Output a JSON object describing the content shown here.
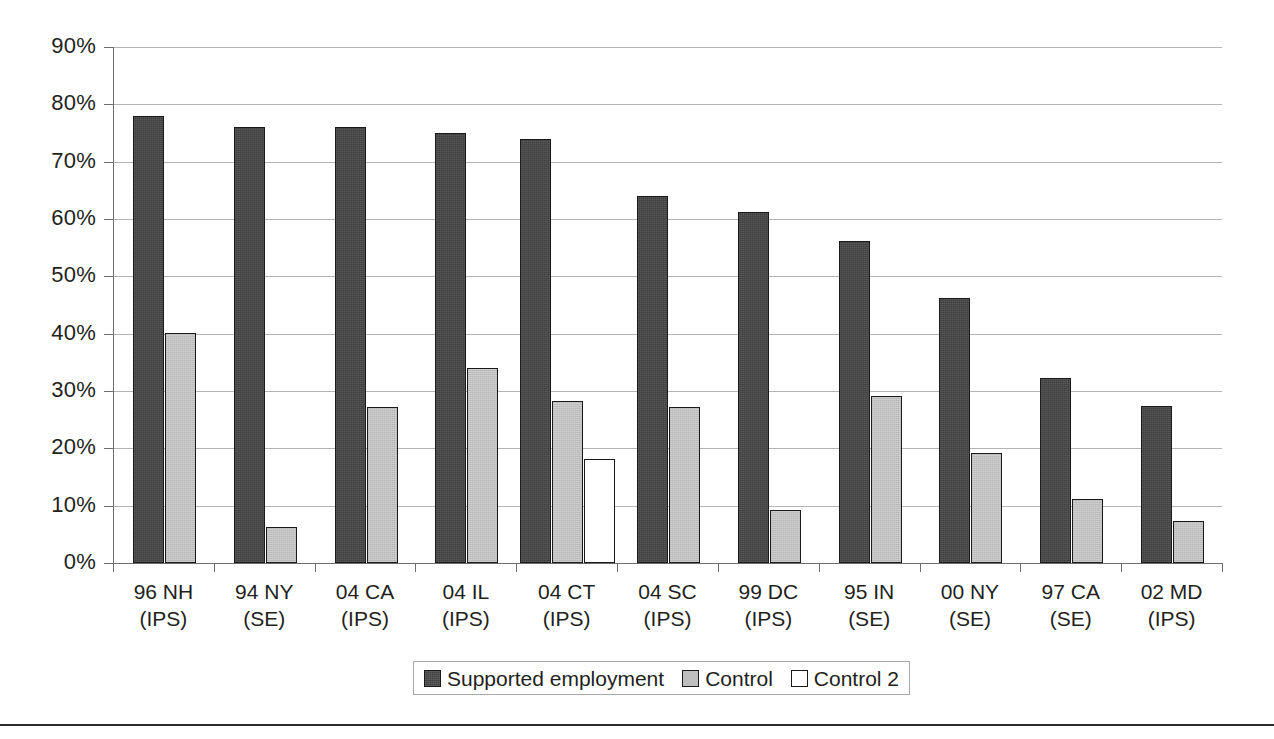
{
  "chart_data": {
    "type": "bar",
    "title": "",
    "xlabel": "",
    "ylabel": "",
    "ylim": [
      0,
      90
    ],
    "ytick_labels": [
      "90%",
      "80%",
      "70%",
      "60%",
      "50%",
      "40%",
      "30%",
      "20%",
      "10%",
      "0%"
    ],
    "ytick_values": [
      90,
      80,
      70,
      60,
      50,
      40,
      30,
      20,
      10,
      0
    ],
    "grid": true,
    "legend_position": "bottom-center",
    "categories": [
      "96 NH (IPS)",
      "94 NY (SE)",
      "04 CA (IPS)",
      "04 IL (IPS)",
      "04 CT (IPS)",
      "04 SC (IPS)",
      "99 DC (IPS)",
      "95 IN (SE)",
      "00 NY (SE)",
      "97 CA (SE)",
      "02 MD (IPS)"
    ],
    "category_lines": [
      {
        "line1": "96 NH",
        "line2": "(IPS)"
      },
      {
        "line1": "94 NY",
        "line2": "(SE)"
      },
      {
        "line1": "04 CA",
        "line2": "(IPS)"
      },
      {
        "line1": "04 IL",
        "line2": "(IPS)"
      },
      {
        "line1": "04 CT",
        "line2": "(IPS)"
      },
      {
        "line1": "04 SC",
        "line2": "(IPS)"
      },
      {
        "line1": "99 DC",
        "line2": "(IPS)"
      },
      {
        "line1": "95 IN",
        "line2": "(SE)"
      },
      {
        "line1": "00 NY",
        "line2": "(SE)"
      },
      {
        "line1": "97 CA",
        "line2": "(SE)"
      },
      {
        "line1": "02 MD",
        "line2": "(IPS)"
      }
    ],
    "series": [
      {
        "name": "Supported employment",
        "color": "#3f3f3f",
        "values": [
          78,
          76,
          76,
          75,
          74,
          64,
          61.2,
          56.2,
          46.2,
          32.3,
          27.3
        ]
      },
      {
        "name": "Control",
        "color": "#bfbfbf",
        "values": [
          40.1,
          6.2,
          27.2,
          34.1,
          28.2,
          27.2,
          9.2,
          29.2,
          19.2,
          11.2,
          7.3
        ]
      },
      {
        "name": "Control 2",
        "color": "#ffffff",
        "values": [
          null,
          null,
          null,
          null,
          18.1,
          null,
          null,
          null,
          null,
          null,
          null
        ]
      }
    ]
  },
  "legend": {
    "entries": [
      {
        "label": "Supported employment"
      },
      {
        "label": "Control"
      },
      {
        "label": "Control 2"
      }
    ]
  }
}
